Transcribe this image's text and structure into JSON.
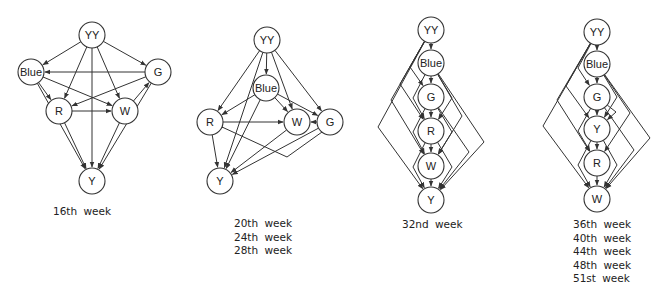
{
  "figure": {
    "stroke_color": "#333333",
    "background": "#ffffff",
    "node_radius": 13
  },
  "diagrams": [
    {
      "id": "week16",
      "captions": [
        "16th week"
      ],
      "caption_pos": [
        53,
        205
      ],
      "nodes": [
        {
          "id": "YY",
          "label": "YY",
          "x": 92,
          "y": 35
        },
        {
          "id": "Blue",
          "label": "Blue",
          "x": 31,
          "y": 72
        },
        {
          "id": "G",
          "label": "G",
          "x": 158,
          "y": 72
        },
        {
          "id": "R",
          "label": "R",
          "x": 59,
          "y": 111
        },
        {
          "id": "W",
          "label": "W",
          "x": 125,
          "y": 111
        },
        {
          "id": "Y",
          "label": "Y",
          "x": 92,
          "y": 181
        }
      ],
      "edges": [
        [
          "YY",
          "Blue"
        ],
        [
          "YY",
          "G"
        ],
        [
          "YY",
          "R"
        ],
        [
          "YY",
          "W"
        ],
        [
          "YY",
          "Y"
        ],
        [
          "G",
          "Blue"
        ],
        [
          "Blue",
          "R"
        ],
        [
          "Blue",
          "W"
        ],
        [
          "G",
          "R"
        ],
        [
          "W",
          "G"
        ],
        [
          "R",
          "W"
        ],
        [
          "Blue",
          "Y"
        ],
        [
          "R",
          "Y"
        ],
        [
          "W",
          "Y"
        ],
        [
          "G",
          "Y"
        ]
      ]
    },
    {
      "id": "week20-28",
      "captions": [
        "20th week",
        "24th week",
        "28th week"
      ],
      "caption_pos": [
        234,
        218
      ],
      "nodes": [
        {
          "id": "YY",
          "label": "YY",
          "x": 267,
          "y": 40
        },
        {
          "id": "Blue",
          "label": "Blue",
          "x": 266,
          "y": 88
        },
        {
          "id": "R",
          "label": "R",
          "x": 210,
          "y": 122
        },
        {
          "id": "W",
          "label": "W",
          "x": 297,
          "y": 122
        },
        {
          "id": "G",
          "label": "G",
          "x": 330,
          "y": 122
        },
        {
          "id": "Y",
          "label": "Y",
          "x": 220,
          "y": 181
        }
      ],
      "edges": [
        [
          "YY",
          "Blue"
        ],
        [
          "YY",
          "R"
        ],
        [
          "YY",
          "W"
        ],
        [
          "YY",
          "G"
        ],
        [
          "YY",
          "Y"
        ],
        [
          "Blue",
          "R"
        ],
        [
          "Blue",
          "W"
        ],
        [
          "Blue",
          "G"
        ],
        [
          "Blue",
          "Y"
        ],
        [
          "R",
          "W"
        ],
        [
          "G",
          "W"
        ],
        [
          "R",
          "Y"
        ],
        [
          "W",
          "Y"
        ],
        [
          "G",
          "Y"
        ]
      ],
      "routed_edges": [
        {
          "from": "G",
          "to": "R",
          "points": [
            [
              322,
              132
            ],
            [
              287,
              157
            ],
            [
              222,
              127
            ]
          ]
        }
      ]
    },
    {
      "id": "week32",
      "captions": [
        "32nd week"
      ],
      "caption_pos": [
        402,
        219
      ],
      "nodes": [
        {
          "id": "YY",
          "label": "YY",
          "x": 431,
          "y": 30
        },
        {
          "id": "Blue",
          "label": "Blue",
          "x": 431,
          "y": 63
        },
        {
          "id": "G",
          "label": "G",
          "x": 431,
          "y": 97
        },
        {
          "id": "R",
          "label": "R",
          "x": 431,
          "y": 131
        },
        {
          "id": "W",
          "label": "W",
          "x": 431,
          "y": 166
        },
        {
          "id": "Y",
          "label": "Y",
          "x": 431,
          "y": 200
        }
      ],
      "chain": [
        "YY",
        "Blue",
        "G",
        "R",
        "W",
        "Y"
      ],
      "left_bends": [
        {
          "from": "YY",
          "to": "G",
          "bend": [
            410,
            67
          ]
        },
        {
          "from": "YY",
          "to": "R",
          "bend": [
            400,
            84
          ]
        },
        {
          "from": "YY",
          "to": "W",
          "bend": [
            391,
            100
          ]
        },
        {
          "from": "YY",
          "to": "Y",
          "bend": [
            378,
            127
          ]
        },
        {
          "from": "G",
          "to": "W",
          "bend": [
            413,
            132
          ]
        },
        {
          "from": "Blue",
          "to": "R",
          "bend": [
            413,
            98
          ]
        },
        {
          "from": "R",
          "to": "Y",
          "bend": [
            413,
            167
          ]
        }
      ],
      "right_bends": [
        {
          "from": "Blue",
          "to": "R",
          "bend": [
            452,
            98
          ]
        },
        {
          "from": "Blue",
          "to": "W",
          "bend": [
            462,
            116
          ]
        },
        {
          "from": "Blue",
          "to": "Y",
          "bend": [
            484,
            142
          ]
        },
        {
          "from": "G",
          "to": "W",
          "bend": [
            452,
            132
          ]
        },
        {
          "from": "G",
          "to": "Y",
          "bend": [
            469,
            152
          ]
        },
        {
          "from": "R",
          "to": "Y",
          "bend": [
            452,
            167
          ]
        }
      ]
    },
    {
      "id": "week36-51",
      "captions": [
        "36th week",
        "40th week",
        "44th week",
        "48th week",
        "51st week"
      ],
      "caption_pos": [
        573,
        218
      ],
      "nodes": [
        {
          "id": "YY",
          "label": "YY",
          "x": 597,
          "y": 32
        },
        {
          "id": "Blue",
          "label": "Blue",
          "x": 597,
          "y": 64
        },
        {
          "id": "G",
          "label": "G",
          "x": 597,
          "y": 97
        },
        {
          "id": "Y",
          "label": "Y",
          "x": 597,
          "y": 129
        },
        {
          "id": "R",
          "label": "R",
          "x": 597,
          "y": 163
        },
        {
          "id": "W",
          "label": "W",
          "x": 597,
          "y": 199
        }
      ],
      "chain": [
        "YY",
        "Blue",
        "G",
        "Y",
        "R",
        "W"
      ],
      "left_bends": [
        {
          "from": "YY",
          "to": "G",
          "bend": [
            578,
            68
          ]
        },
        {
          "from": "YY",
          "to": "Y",
          "bend": [
            566,
            86
          ]
        },
        {
          "from": "YY",
          "to": "R",
          "bend": [
            557,
            100
          ]
        },
        {
          "from": "YY",
          "to": "W",
          "bend": [
            543,
            126
          ]
        },
        {
          "from": "G",
          "to": "R",
          "bend": [
            578,
            131
          ]
        },
        {
          "from": "Y",
          "to": "W",
          "bend": [
            578,
            165
          ]
        }
      ],
      "right_bends": [
        {
          "from": "Blue",
          "to": "Y",
          "bend": [
            617,
            97
          ]
        },
        {
          "from": "Blue",
          "to": "R",
          "bend": [
            630,
            113
          ]
        },
        {
          "from": "Blue",
          "to": "W",
          "bend": [
            650,
            138
          ]
        },
        {
          "from": "G",
          "to": "Y",
          "bend": [
            616,
            112
          ]
        },
        {
          "from": "G",
          "to": "W",
          "bend": [
            634,
            150
          ]
        },
        {
          "from": "Y",
          "to": "W",
          "bend": [
            617,
            165
          ]
        }
      ]
    }
  ]
}
